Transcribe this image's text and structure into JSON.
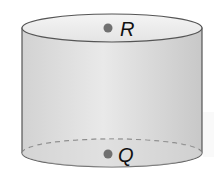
{
  "diagram": {
    "shape": "cylinder",
    "points": [
      {
        "label": "R",
        "position": "center of top face"
      },
      {
        "label": "Q",
        "position": "center of bottom face"
      }
    ],
    "colors": {
      "body": "#dcdcdc",
      "outline": "#555555",
      "point": "#707070"
    }
  }
}
